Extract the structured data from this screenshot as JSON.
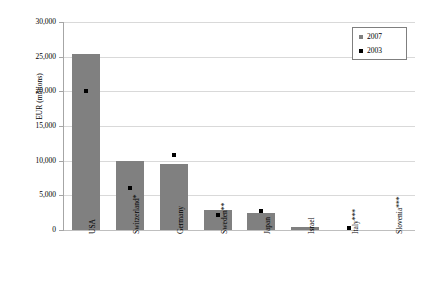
{
  "chart_data": {
    "type": "bar",
    "title": "",
    "xlabel": "",
    "ylabel": "EUR (millions)",
    "ylim": [
      0,
      30000
    ],
    "ytick_labels": [
      "30,000",
      "25,000",
      "20,000",
      "15,000",
      "10,000",
      "5,000",
      "0"
    ],
    "ytick_values": [
      30000,
      25000,
      20000,
      15000,
      10000,
      5000,
      0
    ],
    "grid": true,
    "legend_position": "top-right",
    "categories": [
      "USA",
      "Switzerland*",
      "Germany",
      "Sweden**",
      "Japan",
      "Israel",
      "Italy***",
      "Slovenia***"
    ],
    "series": [
      {
        "name": "2007",
        "render": "bar",
        "color": "#808080",
        "values": [
          25400,
          9900,
          9500,
          2900,
          2400,
          400,
          0,
          0
        ]
      },
      {
        "name": "2003",
        "render": "marker",
        "color": "#000000",
        "values": [
          20000,
          6100,
          10800,
          2100,
          2700,
          null,
          300,
          null
        ]
      }
    ]
  },
  "legend": {
    "entries": [
      {
        "label": "2007",
        "color": "#808080"
      },
      {
        "label": "2003",
        "color": "#000000"
      }
    ]
  }
}
